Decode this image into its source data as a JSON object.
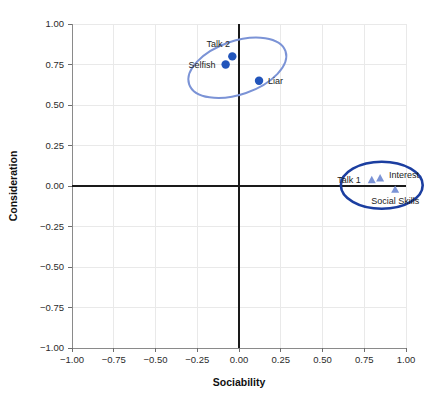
{
  "chart_data": {
    "type": "scatter",
    "title": "",
    "xlabel": "Sociability",
    "ylabel": "Consideration",
    "xlim": [
      -1.0,
      1.0
    ],
    "ylim": [
      -1.0,
      1.0
    ],
    "grid": true,
    "legend": "none",
    "xticks": [
      "-1.00",
      "-0.75",
      "-0.50",
      "-0.25",
      "0.00",
      "0.25",
      "0.50",
      "0.75",
      "1.00"
    ],
    "xtick_values": [
      -1.0,
      -0.75,
      -0.5,
      -0.25,
      0.0,
      0.25,
      0.5,
      0.75,
      1.0
    ],
    "yticks": [
      "1.00",
      "0.75",
      "0.50",
      "0.25",
      "0.00",
      "-0.25",
      "-0.50",
      "-0.75",
      "-1.00"
    ],
    "ytick_values": [
      1.0,
      0.75,
      0.5,
      0.25,
      0.0,
      -0.25,
      -0.5,
      -0.75,
      -1.0
    ],
    "series": [
      {
        "name": "Consideration cluster",
        "marker": "circle",
        "color": "#2255BB",
        "points": [
          {
            "label": "Talk 2",
            "x": -0.04,
            "y": 0.8,
            "label_dx": -14,
            "label_dy": -9,
            "label_anchor": "middle"
          },
          {
            "label": "Selfish",
            "x": -0.08,
            "y": 0.75,
            "label_dx": -10,
            "label_dy": 3,
            "label_anchor": "end"
          },
          {
            "label": "Liar",
            "x": 0.12,
            "y": 0.65,
            "label_dx": 9,
            "label_dy": 3,
            "label_anchor": "start"
          }
        ]
      },
      {
        "name": "Sociability cluster",
        "marker": "triangle",
        "color": "#7B93D6",
        "points": [
          {
            "label": "Talk 1",
            "x": 0.795,
            "y": 0.035,
            "label_dx": -11,
            "label_dy": 3,
            "label_anchor": "end"
          },
          {
            "label": "Interest",
            "x": 0.845,
            "y": 0.045,
            "label_dx": 9,
            "label_dy": -1,
            "label_anchor": "start"
          },
          {
            "label": "Social Skills",
            "x": 0.935,
            "y": -0.025,
            "label_dx": 0,
            "label_dy": 14,
            "label_anchor": "middle"
          }
        ]
      }
    ],
    "ellipses": [
      {
        "name": "consideration-ellipse",
        "cx": -0.01,
        "cy": 0.73,
        "rx": 0.305,
        "ry": 0.165,
        "rotation": -19,
        "stroke": "#7B93D6",
        "stroke_width": 2.0
      },
      {
        "name": "sociability-ellipse",
        "cx": 0.855,
        "cy": 0.005,
        "rx": 0.245,
        "ry": 0.145,
        "rotation": 0,
        "stroke": "#1B3EA0",
        "stroke_width": 2.6
      }
    ],
    "colors": {
      "circle_marker": "#2255BB",
      "triangle_marker": "#7B93D6",
      "ellipse_light": "#7B93D6",
      "ellipse_dark": "#1B3EA0",
      "gridline": "#e9e9e9",
      "zeroline": "#1a1a1a",
      "background": "#ffffff",
      "text": "#1b1b1b"
    }
  }
}
